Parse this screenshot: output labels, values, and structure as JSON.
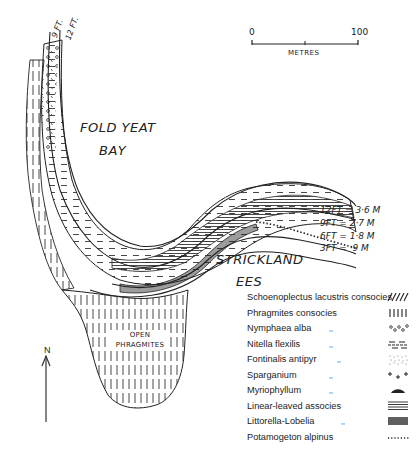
{
  "map": {
    "place_labels": {
      "fold_yeat": "FOLD YEAT",
      "bay": "BAY",
      "strickland": "STRICKLAND",
      "ees": "EES",
      "open": "OPEN",
      "phragmites": "PHRAGMITES"
    },
    "contour_top_labels": [
      "9 FT.",
      "12 FT."
    ],
    "depth_contours": [
      {
        "label": "12FT = 3·6 M"
      },
      {
        "label": "9FT = 2·7 M"
      },
      {
        "label": "6FT = 1·8 M"
      },
      {
        "label": "3FT = ·9 M"
      }
    ],
    "scale_bar": {
      "start": "0",
      "end": "100",
      "unit": "METRES"
    },
    "north_arrow": {
      "label": "N"
    }
  },
  "legend": {
    "items": [
      {
        "name": "Schoenoplectus lacustris consocies",
        "ditto": "",
        "symbol": "diagonal-hatch"
      },
      {
        "name": "Phragmites consocies",
        "ditto": "",
        "symbol": "vertical-bars"
      },
      {
        "name": "Nymphaea alba",
        "ditto": ",,",
        "symbol": "small-circles"
      },
      {
        "name": "Nitella flexilis",
        "ditto": ",,",
        "symbol": "dashes"
      },
      {
        "name": "Fontinalis antipyr",
        "ditto": ",,",
        "symbol": "stipple"
      },
      {
        "name": "Sparganium",
        "ditto": ",,",
        "symbol": "plus-signs"
      },
      {
        "name": "Myriophyllum",
        "ditto": ",,",
        "symbol": "mound"
      },
      {
        "name": "Linear-leaved associes",
        "ditto": "",
        "symbol": "horizontal-lines"
      },
      {
        "name": "Littorella-Lobelia",
        "ditto": ",,",
        "symbol": "dense-vertical"
      },
      {
        "name": "Potamogeton alpinus",
        "ditto": "",
        "symbol": "dotted-line"
      }
    ]
  }
}
